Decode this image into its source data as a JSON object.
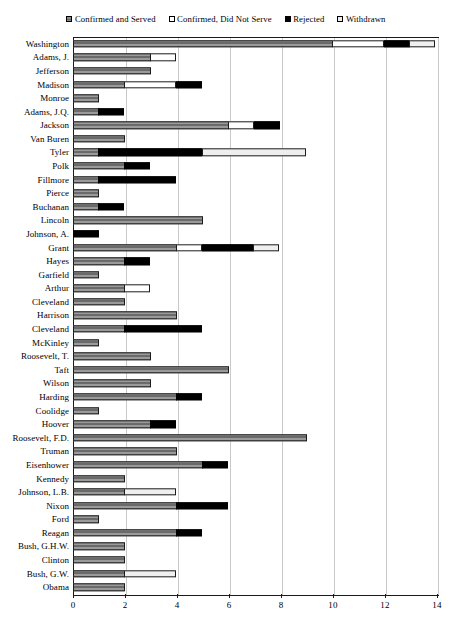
{
  "chart_data": {
    "type": "bar",
    "orientation": "horizontal",
    "stacked": true,
    "title": "",
    "subtitle": "",
    "xlabel": "",
    "ylabel": "",
    "xlim": [
      0,
      14
    ],
    "xticks": [
      0,
      2,
      4,
      6,
      8,
      10,
      12,
      14
    ],
    "xtick_labels": [
      "0",
      "2",
      "4",
      "6",
      "8",
      "10",
      "12",
      "14"
    ],
    "grid": true,
    "grid_axis": "x",
    "legend_position": "top",
    "series": [
      {
        "name": "Confirmed and Served",
        "key": "served",
        "color": "#8f8f8f",
        "pattern": "horizontal-hatch"
      },
      {
        "name": "Confirmed, Did Not Serve",
        "key": "notserve",
        "color": "#ffffff",
        "pattern": "solid"
      },
      {
        "name": "Rejected",
        "key": "rejected",
        "color": "#000000",
        "pattern": "solid"
      },
      {
        "name": "Withdrawn",
        "key": "withdrawn",
        "color": "#efefef",
        "pattern": "solid"
      }
    ],
    "categories": [
      "Washington",
      "Adams, J.",
      "Jefferson",
      "Madison",
      "Monroe",
      "Adams, J.Q.",
      "Jackson",
      "Van Buren",
      "Tyler",
      "Polk",
      "Fillmore",
      "Pierce",
      "Buchanan",
      "Lincoln",
      "Johnson, A.",
      "Grant",
      "Hayes",
      "Garfield",
      "Arthur",
      "Cleveland",
      "Harrison",
      "Cleveland",
      "McKinley",
      "Roosevelt, T.",
      "Taft",
      "Wilson",
      "Harding",
      "Coolidge",
      "Hoover",
      "Roosevelt, F.D.",
      "Truman",
      "Eisenhower",
      "Kennedy",
      "Johnson, L.B.",
      "Nixon",
      "Ford",
      "Reagan",
      "Bush, G.H.W.",
      "Clinton",
      "Bush, G.W.",
      "Obama"
    ],
    "rows": [
      {
        "name": "Washington",
        "served": 10,
        "notserve": 2,
        "rejected": 1,
        "withdrawn": 1,
        "total": 14
      },
      {
        "name": "Adams, J.",
        "served": 3,
        "notserve": 1,
        "rejected": 0,
        "withdrawn": 0,
        "total": 4
      },
      {
        "name": "Jefferson",
        "served": 3,
        "notserve": 0,
        "rejected": 0,
        "withdrawn": 0,
        "total": 3
      },
      {
        "name": "Madison",
        "served": 2,
        "notserve": 2,
        "rejected": 1,
        "withdrawn": 0,
        "total": 5
      },
      {
        "name": "Monroe",
        "served": 1,
        "notserve": 0,
        "rejected": 0,
        "withdrawn": 0,
        "total": 1
      },
      {
        "name": "Adams, J.Q.",
        "served": 1,
        "notserve": 0,
        "rejected": 1,
        "withdrawn": 0,
        "total": 2
      },
      {
        "name": "Jackson",
        "served": 6,
        "notserve": 1,
        "rejected": 1,
        "withdrawn": 0,
        "total": 8
      },
      {
        "name": "Van Buren",
        "served": 2,
        "notserve": 0,
        "rejected": 0,
        "withdrawn": 0,
        "total": 2
      },
      {
        "name": "Tyler",
        "served": 1,
        "notserve": 0,
        "rejected": 4,
        "withdrawn": 4,
        "total": 9
      },
      {
        "name": "Polk",
        "served": 2,
        "notserve": 0,
        "rejected": 1,
        "withdrawn": 0,
        "total": 3
      },
      {
        "name": "Fillmore",
        "served": 1,
        "notserve": 0,
        "rejected": 3,
        "withdrawn": 0,
        "total": 4
      },
      {
        "name": "Pierce",
        "served": 1,
        "notserve": 0,
        "rejected": 0,
        "withdrawn": 0,
        "total": 1
      },
      {
        "name": "Buchanan",
        "served": 1,
        "notserve": 0,
        "rejected": 1,
        "withdrawn": 0,
        "total": 2
      },
      {
        "name": "Lincoln",
        "served": 5,
        "notserve": 0,
        "rejected": 0,
        "withdrawn": 0,
        "total": 5
      },
      {
        "name": "Johnson, A.",
        "served": 0,
        "notserve": 0,
        "rejected": 1,
        "withdrawn": 0,
        "total": 1
      },
      {
        "name": "Grant",
        "served": 4,
        "notserve": 1,
        "rejected": 2,
        "withdrawn": 1,
        "total": 8
      },
      {
        "name": "Hayes",
        "served": 2,
        "notserve": 0,
        "rejected": 1,
        "withdrawn": 0,
        "total": 3
      },
      {
        "name": "Garfield",
        "served": 1,
        "notserve": 0,
        "rejected": 0,
        "withdrawn": 0,
        "total": 1
      },
      {
        "name": "Arthur",
        "served": 2,
        "notserve": 1,
        "rejected": 0,
        "withdrawn": 0,
        "total": 3
      },
      {
        "name": "Cleveland",
        "served": 2,
        "notserve": 0,
        "rejected": 0,
        "withdrawn": 0,
        "total": 2
      },
      {
        "name": "Harrison",
        "served": 4,
        "notserve": 0,
        "rejected": 0,
        "withdrawn": 0,
        "total": 4
      },
      {
        "name": "Cleveland",
        "served": 2,
        "notserve": 0,
        "rejected": 3,
        "withdrawn": 0,
        "total": 5
      },
      {
        "name": "McKinley",
        "served": 1,
        "notserve": 0,
        "rejected": 0,
        "withdrawn": 0,
        "total": 1
      },
      {
        "name": "Roosevelt, T.",
        "served": 3,
        "notserve": 0,
        "rejected": 0,
        "withdrawn": 0,
        "total": 3
      },
      {
        "name": "Taft",
        "served": 6,
        "notserve": 0,
        "rejected": 0,
        "withdrawn": 0,
        "total": 6
      },
      {
        "name": "Wilson",
        "served": 3,
        "notserve": 0,
        "rejected": 0,
        "withdrawn": 0,
        "total": 3
      },
      {
        "name": "Harding",
        "served": 4,
        "notserve": 0,
        "rejected": 1,
        "withdrawn": 0,
        "total": 5
      },
      {
        "name": "Coolidge",
        "served": 1,
        "notserve": 0,
        "rejected": 0,
        "withdrawn": 0,
        "total": 1
      },
      {
        "name": "Hoover",
        "served": 3,
        "notserve": 0,
        "rejected": 1,
        "withdrawn": 0,
        "total": 4
      },
      {
        "name": "Roosevelt, F.D.",
        "served": 9,
        "notserve": 0,
        "rejected": 0,
        "withdrawn": 0,
        "total": 9
      },
      {
        "name": "Truman",
        "served": 4,
        "notserve": 0,
        "rejected": 0,
        "withdrawn": 0,
        "total": 4
      },
      {
        "name": "Eisenhower",
        "served": 5,
        "notserve": 0,
        "rejected": 1,
        "withdrawn": 0,
        "total": 6
      },
      {
        "name": "Kennedy",
        "served": 2,
        "notserve": 0,
        "rejected": 0,
        "withdrawn": 0,
        "total": 2
      },
      {
        "name": "Johnson, L.B.",
        "served": 2,
        "notserve": 0,
        "rejected": 0,
        "withdrawn": 2,
        "total": 4
      },
      {
        "name": "Nixon",
        "served": 4,
        "notserve": 0,
        "rejected": 2,
        "withdrawn": 0,
        "total": 6
      },
      {
        "name": "Ford",
        "served": 1,
        "notserve": 0,
        "rejected": 0,
        "withdrawn": 0,
        "total": 1
      },
      {
        "name": "Reagan",
        "served": 4,
        "notserve": 0,
        "rejected": 1,
        "withdrawn": 0,
        "total": 5
      },
      {
        "name": "Bush, G.H.W.",
        "served": 2,
        "notserve": 0,
        "rejected": 0,
        "withdrawn": 0,
        "total": 2
      },
      {
        "name": "Clinton",
        "served": 2,
        "notserve": 0,
        "rejected": 0,
        "withdrawn": 0,
        "total": 2
      },
      {
        "name": "Bush, G.W.",
        "served": 2,
        "notserve": 0,
        "rejected": 0,
        "withdrawn": 2,
        "total": 4
      },
      {
        "name": "Obama",
        "served": 2,
        "notserve": 0,
        "rejected": 0,
        "withdrawn": 0,
        "total": 2
      }
    ]
  },
  "legend": {
    "items": [
      {
        "label": "Confirmed and Served",
        "swatch": "served"
      },
      {
        "label": "Confirmed, Did Not Serve",
        "swatch": "notserve"
      },
      {
        "label": "Rejected",
        "swatch": "rejected"
      },
      {
        "label": "Withdrawn",
        "swatch": "withdrawn"
      }
    ]
  },
  "colors": {
    "served": "#8f8f8f",
    "notserve": "#ffffff",
    "rejected": "#000000",
    "withdrawn": "#efefef",
    "axis": "#1a1a1a",
    "grid": "#c9c9c9"
  }
}
